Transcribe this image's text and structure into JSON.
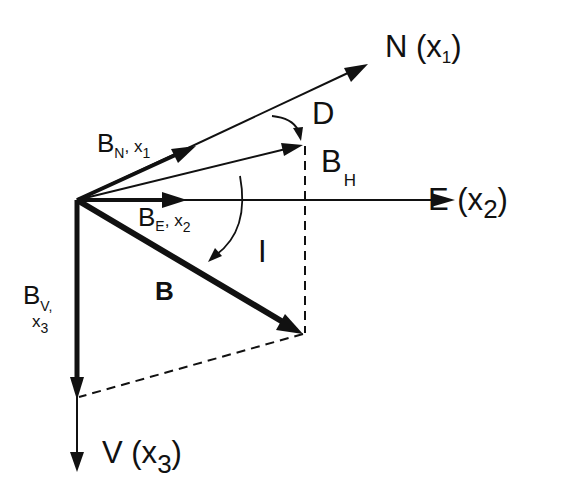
{
  "diagram": {
    "colors": {
      "ink": "#111111",
      "background": "#ffffff"
    },
    "axes": {
      "north": {
        "letter": "N",
        "open": " (x",
        "sub": "1",
        "close": ")"
      },
      "east": {
        "letter": "E",
        "open": " (x",
        "sub": "2",
        "close": ")"
      },
      "vertical": {
        "letter": "V",
        "open": " (x",
        "sub": "3",
        "close": ")"
      }
    },
    "components": {
      "bn": {
        "main": "B",
        "sub": "N",
        "sep": ", x",
        "sub2": "1"
      },
      "be": {
        "main": "B",
        "sub": "E",
        "sep": ", x",
        "sub2": "2"
      },
      "bv": {
        "main": "B",
        "sub": "V,",
        "line2": "x",
        "sub2": "3"
      },
      "bh": {
        "main": "B",
        "sub": "H"
      },
      "b": {
        "main": "B"
      }
    },
    "angles": {
      "declination": "D",
      "inclination": "I"
    }
  }
}
